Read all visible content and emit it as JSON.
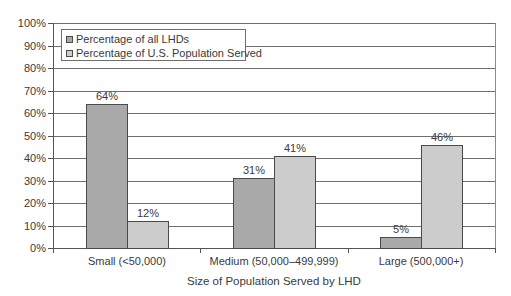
{
  "chart_data": {
    "type": "bar",
    "title": "",
    "xlabel": "Size of Population Served by LHD",
    "ylabel": "",
    "ylim": [
      0,
      100
    ],
    "y_ticks": [
      "0%",
      "10%",
      "20%",
      "30%",
      "40%",
      "50%",
      "60%",
      "70%",
      "80%",
      "90%",
      "100%"
    ],
    "grid": true,
    "legend_position": "upper-left",
    "categories": [
      "Small (<50,000)",
      "Medium (50,000–499,999)",
      "Large (500,000+)"
    ],
    "series": [
      {
        "name": "Percentage of all LHDs",
        "color": "#a9a9a9",
        "values": [
          64,
          31,
          5
        ],
        "labels": [
          "64%",
          "31%",
          "5%"
        ]
      },
      {
        "name": "Percentage of U.S. Population Served",
        "color": "#cccccc",
        "values": [
          12,
          41,
          46
        ],
        "labels": [
          "12%",
          "41%",
          "46%"
        ]
      }
    ]
  },
  "colors": {
    "gridline": "#6e6e6e",
    "axis": "#555555",
    "bar_border": "#4a4a4a",
    "text": "#3a3a3a"
  }
}
